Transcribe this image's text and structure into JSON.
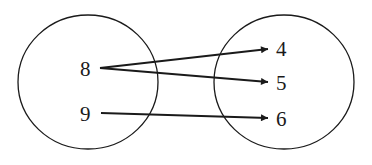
{
  "diagram": {
    "type": "mapping",
    "domain": {
      "elements": [
        {
          "label": "8",
          "x": 88,
          "y": 68
        },
        {
          "label": "9",
          "x": 88,
          "y": 113
        }
      ],
      "circle": {
        "cx": 88,
        "cy": 82,
        "rx": 70,
        "ry": 67
      }
    },
    "range": {
      "elements": [
        {
          "label": "4",
          "x": 282,
          "y": 49
        },
        {
          "label": "5",
          "x": 282,
          "y": 82
        },
        {
          "label": "6",
          "x": 282,
          "y": 120
        }
      ],
      "circle": {
        "cx": 284,
        "cy": 82,
        "rx": 70,
        "ry": 67
      }
    },
    "mappings": [
      {
        "from": "8",
        "to": "4"
      },
      {
        "from": "8",
        "to": "5"
      },
      {
        "from": "9",
        "to": "6"
      }
    ],
    "colors": {
      "stroke": "#1a1a1a",
      "background": "#ffffff"
    }
  }
}
